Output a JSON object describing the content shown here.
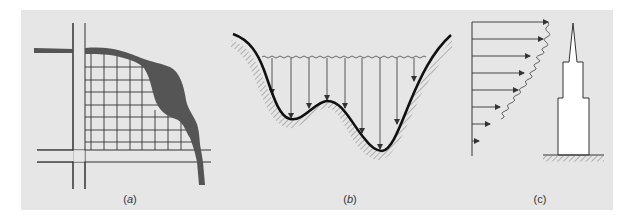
{
  "figure": {
    "background_color": "#e6e6e6",
    "line_color": "#333333",
    "river_color": "#555555",
    "panels": [
      {
        "id": "a",
        "label": "(a)",
        "label_letter": "a",
        "description": "Map view: street grid bounded by roads with a river of varying width along the upper-right edge"
      },
      {
        "id": "b",
        "label": "(b)",
        "label_letter": "b",
        "description": "Cross-section: wavy water surface over an irregular bed with downward pressure arrows",
        "arrow_count": 9
      },
      {
        "id": "c",
        "label": "(c)",
        "label_letter": "c",
        "description": "Wind velocity profile with increasing arrows by height beside a stepped tower on hatched ground",
        "arrow_count": 8
      }
    ]
  }
}
